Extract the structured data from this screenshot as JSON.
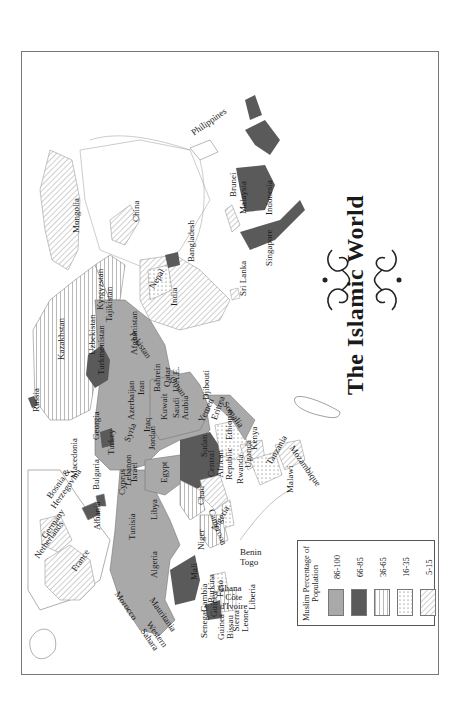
{
  "title": "The Islamic World",
  "legend": {
    "title": "Muslim Percentage of\nPopulation",
    "items": [
      {
        "range": "86-100",
        "fill": "#a9a9a9",
        "pattern": "solid"
      },
      {
        "range": "66-85",
        "fill": "#5a5a5a",
        "pattern": "solid"
      },
      {
        "range": "36-65",
        "fill": "#ffffff",
        "pattern": "vertical-lines"
      },
      {
        "range": "16-35",
        "fill": "#ffffff",
        "pattern": "dots"
      },
      {
        "range": "5-15",
        "fill": "#ffffff",
        "pattern": "diagonal-lines"
      }
    ]
  },
  "colors": {
    "c86_100": "#a9a9a9",
    "c66_85": "#5a5a5a",
    "border": "#777777",
    "coast": "#9a9a9a"
  },
  "labels": [
    {
      "name": "Netherlands",
      "x": 33,
      "y": 555,
      "rot": -55
    },
    {
      "name": "Germany",
      "x": 40,
      "y": 535,
      "rot": -55
    },
    {
      "name": "Bosnia &\nHerzegovina",
      "x": 42,
      "y": 500,
      "rot": -55
    },
    {
      "name": "France",
      "x": 70,
      "y": 568,
      "rot": -55
    },
    {
      "name": "Macedonia",
      "x": 70,
      "y": 478,
      "rot": -90
    },
    {
      "name": "Bulgaria",
      "x": 92,
      "y": 490,
      "rot": -90
    },
    {
      "name": "Albania",
      "x": 93,
      "y": 530,
      "rot": -90
    },
    {
      "name": "Cyprus",
      "x": 118,
      "y": 495,
      "rot": -90
    },
    {
      "name": "Lebanon",
      "x": 124,
      "y": 486,
      "rot": -90
    },
    {
      "name": "Israel",
      "x": 130,
      "y": 482,
      "rot": -90
    },
    {
      "name": "Tunisia",
      "x": 128,
      "y": 540,
      "rot": -90
    },
    {
      "name": "Libya",
      "x": 150,
      "y": 520,
      "rot": -90
    },
    {
      "name": "Algeria",
      "x": 150,
      "y": 578,
      "rot": -90
    },
    {
      "name": "Morocco",
      "x": 120,
      "y": 590,
      "rot": 55
    },
    {
      "name": "Western\nSahara",
      "x": 152,
      "y": 620,
      "rot": 55
    },
    {
      "name": "Mauritania",
      "x": 155,
      "y": 596,
      "rot": 55
    },
    {
      "name": "Mali",
      "x": 190,
      "y": 580,
      "rot": -90
    },
    {
      "name": "Senegal",
      "x": 200,
      "y": 638,
      "rot": -90
    },
    {
      "name": "Gambia",
      "x": 200,
      "y": 612,
      "rot": -90
    },
    {
      "name": "Burkina\nFaso",
      "x": 207,
      "y": 603,
      "rot": -90
    },
    {
      "name": "Guinea",
      "x": 210,
      "y": 617,
      "rot": -90
    },
    {
      "name": "Guinea\nBissau",
      "x": 217,
      "y": 640,
      "rot": -90
    },
    {
      "name": "Sierra\nLeone",
      "x": 232,
      "y": 632,
      "rot": -90
    },
    {
      "name": "Liberia",
      "x": 248,
      "y": 610,
      "rot": -90
    },
    {
      "name": "Ghana",
      "x": 218,
      "y": 584,
      "rot": 0
    },
    {
      "name": "Côte\nd'Ivoire",
      "x": 220,
      "y": 593,
      "rot": 0
    },
    {
      "name": "Benin",
      "x": 240,
      "y": 548,
      "rot": 0
    },
    {
      "name": "Togo",
      "x": 240,
      "y": 558,
      "rot": 0
    },
    {
      "name": "Niger",
      "x": 197,
      "y": 550,
      "rot": -90
    },
    {
      "name": "Nigeria",
      "x": 210,
      "y": 528,
      "rot": -60
    },
    {
      "name": "Cameroon",
      "x": 215,
      "y": 508,
      "rot": 70
    },
    {
      "name": "Chad",
      "x": 197,
      "y": 505,
      "rot": -90
    },
    {
      "name": "Central\nAfrican\nRepublic",
      "x": 207,
      "y": 480,
      "rot": -90
    },
    {
      "name": "Egypt",
      "x": 160,
      "y": 483,
      "rot": -90
    },
    {
      "name": "Sudan",
      "x": 200,
      "y": 457,
      "rot": -90
    },
    {
      "name": "Rwanda",
      "x": 236,
      "y": 484,
      "rot": -90
    },
    {
      "name": "Uganda",
      "x": 244,
      "y": 468,
      "rot": -90
    },
    {
      "name": "Kenya",
      "x": 250,
      "y": 450,
      "rot": -90
    },
    {
      "name": "Ethiopia",
      "x": 225,
      "y": 440,
      "rot": -90
    },
    {
      "name": "Eritrea",
      "x": 210,
      "y": 418,
      "rot": -70
    },
    {
      "name": "Tanzania",
      "x": 265,
      "y": 462,
      "rot": -60
    },
    {
      "name": "Malawi",
      "x": 286,
      "y": 493,
      "rot": -90
    },
    {
      "name": "Mozambique",
      "x": 295,
      "y": 444,
      "rot": 55
    },
    {
      "name": "Somalia",
      "x": 228,
      "y": 400,
      "rot": 55
    },
    {
      "name": "Djibouti",
      "x": 202,
      "y": 400,
      "rot": -90
    },
    {
      "name": "Yemen",
      "x": 197,
      "y": 420,
      "rot": -65
    },
    {
      "name": "Oman",
      "x": 175,
      "y": 375,
      "rot": 55
    },
    {
      "name": "U.A.E.",
      "x": 172,
      "y": 392,
      "rot": -90
    },
    {
      "name": "Saudi\nArabia",
      "x": 172,
      "y": 420,
      "rot": -90
    },
    {
      "name": "Kuwait",
      "x": 160,
      "y": 420,
      "rot": -90
    },
    {
      "name": "Qatar",
      "x": 163,
      "y": 387,
      "rot": -90
    },
    {
      "name": "Bahrein",
      "x": 153,
      "y": 392,
      "rot": -90
    },
    {
      "name": "Iraq",
      "x": 143,
      "y": 432,
      "rot": -90
    },
    {
      "name": "Jordan",
      "x": 148,
      "y": 450,
      "rot": -90
    },
    {
      "name": "Syria",
      "x": 123,
      "y": 440,
      "rot": -70
    },
    {
      "name": "Iran",
      "x": 137,
      "y": 395,
      "rot": -90
    },
    {
      "name": "Azerbaijan",
      "x": 127,
      "y": 420,
      "rot": -90
    },
    {
      "name": "Turkey",
      "x": 107,
      "y": 455,
      "rot": -90
    },
    {
      "name": "Georgia",
      "x": 92,
      "y": 440,
      "rot": -90
    },
    {
      "name": "Russia",
      "x": 32,
      "y": 412,
      "rot": -90
    },
    {
      "name": "Kazakhstan",
      "x": 57,
      "y": 360,
      "rot": -90
    },
    {
      "name": "Uzbekistan",
      "x": 88,
      "y": 355,
      "rot": -90
    },
    {
      "name": "Turkmenistan",
      "x": 97,
      "y": 375,
      "rot": -90
    },
    {
      "name": "Kyrgyzstan",
      "x": 96,
      "y": 310,
      "rot": -90
    },
    {
      "name": "Tajikistan",
      "x": 105,
      "y": 322,
      "rot": -90
    },
    {
      "name": "Afghanistan",
      "x": 130,
      "y": 355,
      "rot": -90
    },
    {
      "name": "Pakistan",
      "x": 135,
      "y": 330,
      "rot": 55
    },
    {
      "name": "Mongolia",
      "x": 72,
      "y": 233,
      "rot": -90
    },
    {
      "name": "China",
      "x": 132,
      "y": 222,
      "rot": -90
    },
    {
      "name": "Nepal",
      "x": 148,
      "y": 286,
      "rot": -60
    },
    {
      "name": "India",
      "x": 170,
      "y": 306,
      "rot": -90
    },
    {
      "name": "Bangladesh",
      "x": 187,
      "y": 262,
      "rot": -90
    },
    {
      "name": "Sri Lanka",
      "x": 239,
      "y": 296,
      "rot": -90
    },
    {
      "name": "Singapore",
      "x": 265,
      "y": 266,
      "rot": -90
    },
    {
      "name": "Malaysia",
      "x": 239,
      "y": 214,
      "rot": -90
    },
    {
      "name": "Brunei",
      "x": 229,
      "y": 197,
      "rot": -90
    },
    {
      "name": "Indonesia",
      "x": 265,
      "y": 215,
      "rot": -90
    },
    {
      "name": "Philippines",
      "x": 190,
      "y": 130,
      "rot": -35
    }
  ]
}
